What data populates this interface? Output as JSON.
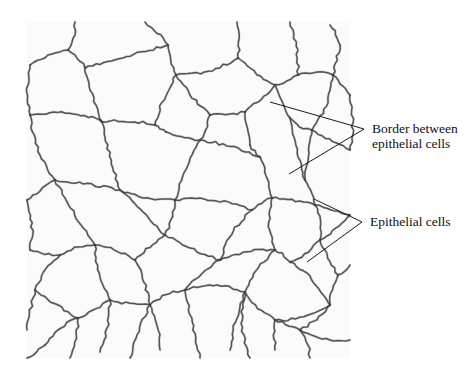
{
  "figure": {
    "tissue_bounds": {
      "x": 27,
      "y": 22,
      "width": 323,
      "height": 336
    },
    "colors": {
      "border_stroke": "#3c3c3c",
      "leader_stroke": "#1a1a1a",
      "label_text": "#111111",
      "background": "#ffffff"
    }
  },
  "labels": {
    "border": {
      "line1": "Border between",
      "line2": "epithelial cells"
    },
    "cells": {
      "text": "Epithelial cells"
    }
  },
  "leaders": {
    "border": {
      "apex": [
        364,
        129
      ],
      "targets": [
        [
          270,
          102
        ],
        [
          289,
          174
        ]
      ]
    },
    "cells": {
      "apex": [
        362,
        222
      ],
      "targets": [
        [
          314,
          199
        ],
        [
          307,
          262
        ]
      ]
    }
  },
  "cell_network": {
    "nodes": {
      "t1": [
        75,
        22
      ],
      "t2": [
        145,
        22
      ],
      "t3": [
        237,
        22
      ],
      "t4": [
        290,
        22
      ],
      "t5": [
        330,
        25
      ],
      "a1": [
        68,
        50
      ],
      "a2": [
        85,
        68
      ],
      "a3": [
        168,
        45
      ],
      "a4": [
        176,
        75
      ],
      "a5": [
        238,
        58
      ],
      "a6": [
        275,
        85
      ],
      "a7": [
        298,
        75
      ],
      "a8": [
        333,
        75
      ],
      "a9": [
        340,
        45
      ],
      "l1": [
        30,
        65
      ],
      "l2": [
        30,
        115
      ],
      "b1": [
        100,
        120
      ],
      "b2": [
        102,
        122
      ],
      "b3": [
        155,
        125
      ],
      "b4": [
        166,
        132
      ],
      "b5": [
        210,
        115
      ],
      "b6": [
        245,
        112
      ],
      "b7": [
        250,
        145
      ],
      "b8": [
        290,
        118
      ],
      "b9": [
        312,
        130
      ],
      "r1": [
        350,
        95
      ],
      "r2": [
        350,
        150
      ],
      "c1": [
        55,
        180
      ],
      "c2": [
        120,
        190
      ],
      "c3": [
        175,
        200
      ],
      "c4": [
        200,
        140
      ],
      "c5": [
        260,
        157
      ],
      "c6": [
        272,
        198
      ],
      "c7": [
        252,
        210
      ],
      "c8": [
        305,
        180
      ],
      "c9": [
        315,
        205
      ],
      "l3": [
        27,
        200
      ],
      "l4": [
        30,
        250
      ],
      "d1": [
        60,
        255
      ],
      "d2": [
        95,
        245
      ],
      "d3": [
        135,
        260
      ],
      "d4": [
        165,
        235
      ],
      "d5": [
        220,
        260
      ],
      "d6": [
        275,
        250
      ],
      "d7": [
        290,
        262
      ],
      "d8": [
        320,
        240
      ],
      "d9": [
        338,
        275
      ],
      "r3": [
        350,
        215
      ],
      "r4": [
        350,
        265
      ],
      "e1": [
        35,
        290
      ],
      "e2": [
        78,
        318
      ],
      "e3": [
        110,
        300
      ],
      "e4": [
        150,
        305
      ],
      "e5": [
        185,
        290
      ],
      "e6": [
        245,
        292
      ],
      "e7": [
        275,
        320
      ],
      "e8": [
        330,
        305
      ],
      "e9": [
        300,
        330
      ],
      "f1": [
        45,
        345
      ],
      "f2": [
        70,
        358
      ],
      "f3": [
        100,
        352
      ],
      "f4": [
        130,
        358
      ],
      "f5": [
        160,
        350
      ],
      "f6": [
        200,
        358
      ],
      "f7": [
        230,
        350
      ],
      "f8": [
        250,
        358
      ],
      "f9": [
        275,
        350
      ],
      "f10": [
        310,
        358
      ],
      "f11": [
        350,
        340
      ],
      "l5": [
        27,
        330
      ],
      "l6": [
        27,
        358
      ]
    },
    "edges": [
      [
        "t1",
        "a1"
      ],
      [
        "a1",
        "l1"
      ],
      [
        "a1",
        "a2"
      ],
      [
        "a2",
        "b1"
      ],
      [
        "t2",
        "a3"
      ],
      [
        "a3",
        "a2"
      ],
      [
        "a3",
        "a4"
      ],
      [
        "t3",
        "a5"
      ],
      [
        "a5",
        "a4"
      ],
      [
        "a5",
        "a6"
      ],
      [
        "t4",
        "a7"
      ],
      [
        "a7",
        "a6"
      ],
      [
        "t5",
        "a9"
      ],
      [
        "a9",
        "a8"
      ],
      [
        "a8",
        "a7"
      ],
      [
        "a8",
        "r1"
      ],
      [
        "l1",
        "l2"
      ],
      [
        "l2",
        "b1"
      ],
      [
        "b1",
        "b2"
      ],
      [
        "b2",
        "b3"
      ],
      [
        "a4",
        "b3"
      ],
      [
        "b3",
        "b4"
      ],
      [
        "a4",
        "b5"
      ],
      [
        "b5",
        "b6"
      ],
      [
        "a6",
        "b6"
      ],
      [
        "b6",
        "b7"
      ],
      [
        "a6",
        "b8"
      ],
      [
        "b8",
        "b9"
      ],
      [
        "a8",
        "b9"
      ],
      [
        "b9",
        "r2"
      ],
      [
        "r1",
        "r2"
      ],
      [
        "l2",
        "c1"
      ],
      [
        "c1",
        "l3"
      ],
      [
        "b2",
        "c2"
      ],
      [
        "c1",
        "c2"
      ],
      [
        "c2",
        "c3"
      ],
      [
        "b4",
        "c4"
      ],
      [
        "c4",
        "b5"
      ],
      [
        "c4",
        "c3"
      ],
      [
        "b7",
        "c5"
      ],
      [
        "c4",
        "c5"
      ],
      [
        "c5",
        "c6"
      ],
      [
        "c6",
        "c7"
      ],
      [
        "c7",
        "c3"
      ],
      [
        "b8",
        "c8"
      ],
      [
        "b9",
        "c8"
      ],
      [
        "c8",
        "c9"
      ],
      [
        "c6",
        "c9"
      ],
      [
        "c9",
        "r3"
      ],
      [
        "l3",
        "l4"
      ],
      [
        "l4",
        "d1"
      ],
      [
        "c1",
        "d2"
      ],
      [
        "d1",
        "d2"
      ],
      [
        "d2",
        "d3"
      ],
      [
        "c2",
        "d4"
      ],
      [
        "d4",
        "d3"
      ],
      [
        "c3",
        "d4"
      ],
      [
        "c7",
        "d5"
      ],
      [
        "d4",
        "d5"
      ],
      [
        "d5",
        "d6"
      ],
      [
        "c6",
        "d6"
      ],
      [
        "d6",
        "d7"
      ],
      [
        "d7",
        "d8"
      ],
      [
        "c9",
        "d8"
      ],
      [
        "d8",
        "r3"
      ],
      [
        "d8",
        "d9"
      ],
      [
        "d9",
        "r4"
      ],
      [
        "d1",
        "e1"
      ],
      [
        "e1",
        "l5"
      ],
      [
        "d2",
        "e3"
      ],
      [
        "e3",
        "e2"
      ],
      [
        "e2",
        "e1"
      ],
      [
        "d3",
        "e4"
      ],
      [
        "e3",
        "e4"
      ],
      [
        "e4",
        "e5"
      ],
      [
        "d5",
        "e5"
      ],
      [
        "d6",
        "e6"
      ],
      [
        "e5",
        "e6"
      ],
      [
        "e6",
        "e7"
      ],
      [
        "d7",
        "e8"
      ],
      [
        "e8",
        "e7"
      ],
      [
        "d9",
        "e8"
      ],
      [
        "e7",
        "e9"
      ],
      [
        "e8",
        "e9"
      ],
      [
        "e2",
        "f2"
      ],
      [
        "e2",
        "f1"
      ],
      [
        "f1",
        "l6"
      ],
      [
        "e3",
        "f3"
      ],
      [
        "e4",
        "f4"
      ],
      [
        "e4",
        "f5"
      ],
      [
        "e5",
        "f6"
      ],
      [
        "e6",
        "f7"
      ],
      [
        "e6",
        "f8"
      ],
      [
        "e7",
        "f9"
      ],
      [
        "e9",
        "f10"
      ],
      [
        "e9",
        "f11"
      ]
    ]
  }
}
